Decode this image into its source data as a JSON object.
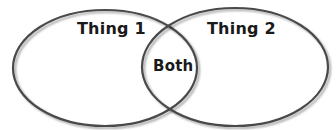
{
  "diagram": {
    "type": "venn",
    "sets": [
      {
        "id": "a",
        "label": "Thing 1"
      },
      {
        "id": "b",
        "label": "Thing 2"
      }
    ],
    "intersection": {
      "label": "Both"
    },
    "colors": {
      "outline": "#4a4a4a",
      "fill": "#ffffff",
      "text": "#1a1a1a"
    }
  }
}
